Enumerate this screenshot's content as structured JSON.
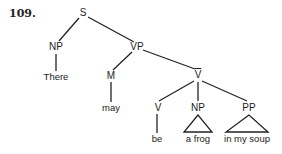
{
  "example_number": "109.",
  "tree": {
    "S": "S",
    "NP_subject": "NP",
    "VP": "VP",
    "M": "M",
    "Vbar": "V",
    "V": "V",
    "NP_object": "NP",
    "PP": "PP"
  },
  "leaves": {
    "there": "There",
    "may": "may",
    "be": "be",
    "a_frog": "a frog",
    "in_my_soup": "in my soup"
  },
  "notes": {
    "Vbar_has_overbar": true,
    "triangle_nodes": [
      "NP_object",
      "PP"
    ]
  }
}
